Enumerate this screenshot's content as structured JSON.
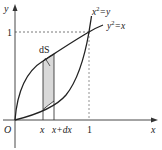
{
  "figure": {
    "type": "area-between-curves",
    "axes": {
      "x_label": "x",
      "y_label": "y",
      "origin_label": "O",
      "x_tick_labels": [
        "x",
        "x+dx",
        "1"
      ],
      "y_tick_labels": [
        "1"
      ]
    },
    "curves": [
      {
        "label_base": "x",
        "label_exp": "2",
        "label_rest": "=y",
        "equation": "y = x^2"
      },
      {
        "label_base": "y",
        "label_exp": "2",
        "label_rest": "=x",
        "equation": "y = sqrt(x)"
      }
    ],
    "strip": {
      "label": "dS",
      "from": "x",
      "to": "x+dx",
      "fill": "#d9d9d9"
    },
    "colors": {
      "curve": "#222222",
      "axis": "#333333",
      "dashed": "#555555"
    }
  }
}
